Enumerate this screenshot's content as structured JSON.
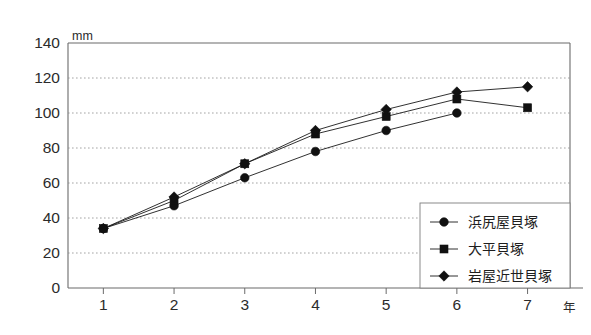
{
  "chart_data": {
    "type": "line",
    "title": "",
    "subtitle": "",
    "xlabel": "年",
    "ylabel": "mm",
    "x": [
      1,
      2,
      3,
      4,
      5,
      6,
      7
    ],
    "xtick_labels": [
      "1",
      "2",
      "3",
      "4",
      "5",
      "6",
      "7"
    ],
    "ytick_labels": [
      "0",
      "20",
      "40",
      "60",
      "80",
      "100",
      "120",
      "140"
    ],
    "yticks": [
      0,
      20,
      40,
      60,
      80,
      100,
      120,
      140
    ],
    "xlim": [
      0.5,
      7.6
    ],
    "ylim": [
      0,
      140
    ],
    "grid": "horizontal-dotted",
    "legend_position": "bottom-right",
    "series": [
      {
        "name": "浜尻屋貝塚",
        "marker": "circle",
        "x": [
          1,
          2,
          3,
          4,
          5,
          6
        ],
        "values": [
          34,
          47,
          63,
          78,
          90,
          100
        ]
      },
      {
        "name": "大平貝塚",
        "marker": "square",
        "x": [
          1,
          2,
          3,
          4,
          5,
          6,
          7
        ],
        "values": [
          34,
          50,
          71,
          88,
          98,
          108,
          103
        ]
      },
      {
        "name": "岩屋近世貝塚",
        "marker": "diamond",
        "x": [
          1,
          2,
          3,
          4,
          5,
          6,
          7
        ],
        "values": [
          34,
          52,
          71,
          90,
          102,
          112,
          115
        ]
      }
    ],
    "colors": {
      "series_line": "#1a1a1a",
      "marker": "#111111",
      "axis": "#6b6b6b",
      "grid": "#8d8d8d",
      "background": "#ffffff"
    }
  },
  "axes": {
    "y_unit_label": "mm",
    "x_unit_label": "年"
  },
  "legend": {
    "entries": [
      {
        "label": "浜尻屋貝塚",
        "marker": "circle"
      },
      {
        "label": "大平貝塚",
        "marker": "square"
      },
      {
        "label": "岩屋近世貝塚",
        "marker": "diamond"
      }
    ]
  }
}
